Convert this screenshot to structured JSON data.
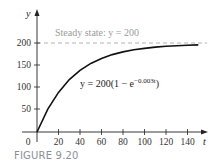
{
  "caption": "FIGURE 9.20",
  "chart_data": {
    "type": "line",
    "title": "",
    "xlabel": "t",
    "ylabel": "y",
    "xlim": [
      0,
      150
    ],
    "ylim": [
      0,
      215
    ],
    "x_ticks": [
      0,
      20,
      40,
      60,
      80,
      100,
      120,
      140
    ],
    "y_ticks": [
      50,
      100,
      150,
      200
    ],
    "grid": false,
    "annotations": [
      {
        "text": "Steady state: y = 200",
        "type": "dashed-horizontal-line",
        "y": 200,
        "color": "#9a9a9a"
      },
      {
        "text": "y = 200(1 − e^(−0.003t))",
        "type": "curve-label"
      }
    ],
    "series": [
      {
        "name": "y = 200(1 − e^(−0.003t))",
        "x": [
          0,
          10,
          20,
          30,
          40,
          50,
          60,
          70,
          80,
          90,
          100,
          110,
          120,
          130,
          140,
          150
        ],
        "values": [
          0,
          52,
          90,
          119,
          140,
          156,
          167,
          176,
          182,
          187,
          190,
          193,
          195,
          196,
          197,
          198
        ]
      }
    ]
  },
  "labels": {
    "y_axis": "y",
    "x_axis": "t",
    "origin": "0",
    "steady_state": "Steady state: y = 200",
    "equation_main": "y = 200(1 − e",
    "equation_exp": "−0.003t",
    "equation_close": ")",
    "x_tick_labels": [
      "20",
      "40",
      "60",
      "80",
      "100",
      "120",
      "140"
    ],
    "y_tick_labels": [
      "50",
      "100",
      "150",
      "200"
    ]
  }
}
